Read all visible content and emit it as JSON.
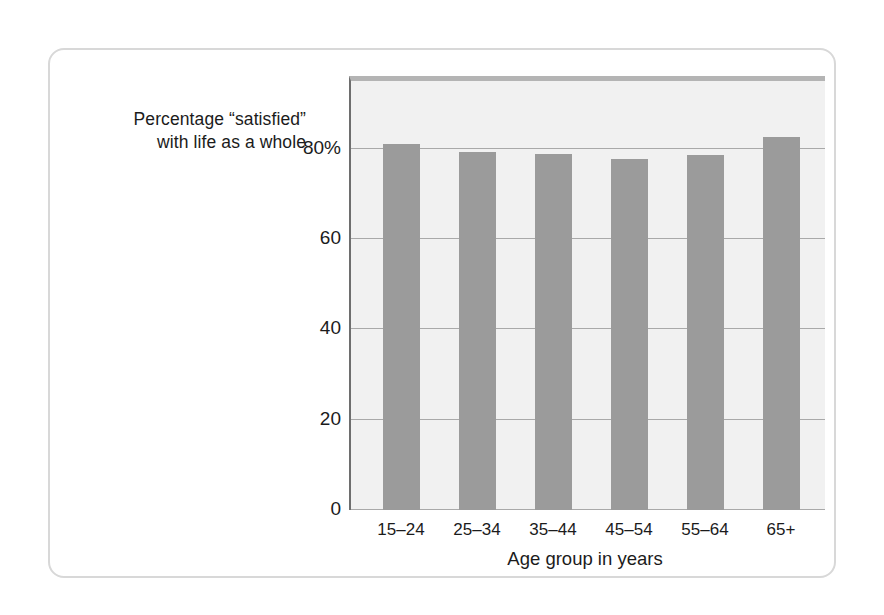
{
  "chart_data": {
    "type": "bar",
    "title": "",
    "ylabel": "Percentage “satisfied” with life as a whole",
    "ylabel_lines": [
      "Percentage “satisfied”",
      "with life as a whole"
    ],
    "xlabel": "Age group in years",
    "categories": [
      "15–24",
      "25–34",
      "35–44",
      "45–54",
      "55–64",
      "65+"
    ],
    "values": [
      81,
      79.2,
      78.8,
      77.8,
      78.7,
      82.5
    ],
    "ylim": [
      0,
      95
    ],
    "yticks": [
      0,
      20,
      40,
      60,
      80
    ],
    "ytick_labels": [
      "0",
      "20",
      "40",
      "60",
      "80%"
    ],
    "grid": true,
    "legend": "none",
    "bar_color": "#9b9b9b",
    "plot_background": "#f1f1f1",
    "gridline_color": "#a9a9a9",
    "axis_color": "#6e6e6e",
    "card_border_color": "#d8d8d8"
  }
}
